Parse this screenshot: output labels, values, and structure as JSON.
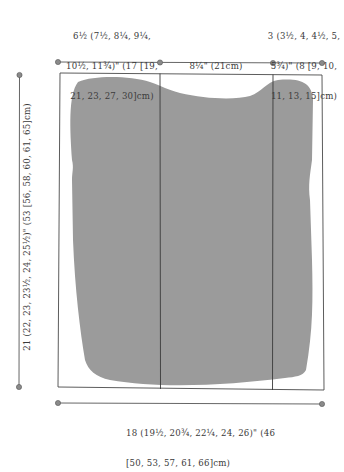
{
  "diagram": {
    "type": "garment-schematic",
    "shape_fill": "#9a9a9a",
    "line_color": "#4a4a4a",
    "dot_color": "#808080",
    "measurements": {
      "top_left_width": "6½ (7½, 8¼, 9¼, 10½, 11¾)\" (17 [19, 21, 23, 27, 30]cm)",
      "top_left_lines": [
        "6½ (7½, 8¼, 9¼,",
        "10½, 11¾)\" (17 [19,",
        "21, 23, 27, 30]cm)"
      ],
      "top_middle_width": "8¼\" (21cm)",
      "top_right_width": "3 (3½, 4, 4½, 5, 5¾)\" (8 [9, 10, 11, 13, 15]cm)",
      "top_right_lines": [
        "3 (3½, 4, 4½, 5,",
        "5¾)\" (8 [9, 10,",
        "11, 13, 15]cm)"
      ],
      "left_height": "21 (22, 23, 23½, 24, 25½)\" (53 [56, 58, 60, 61, 65]cm)",
      "bottom_width": "18 (19½, 20¾, 22¼, 24, 26)\" (46 [50, 53, 57, 61, 66]cm)",
      "bottom_lines": [
        "18 (19½, 20¾, 22¼, 24, 26)\" (46",
        "[50, 53, 57, 61, 66]cm)"
      ]
    }
  }
}
